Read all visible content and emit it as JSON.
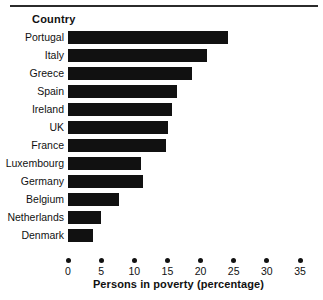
{
  "chart_data": {
    "type": "bar",
    "orientation": "horizontal",
    "title": "",
    "xlabel": "Persons in poverty (percentage)",
    "ylabel": "Country",
    "categories": [
      "Portugal",
      "Italy",
      "Greece",
      "Spain",
      "Ireland",
      "UK",
      "France",
      "Luxembourg",
      "Germany",
      "Belgium",
      "Netherlands",
      "Denmark"
    ],
    "values": [
      24.1,
      21.0,
      18.7,
      16.4,
      15.7,
      15.1,
      14.8,
      11.0,
      11.3,
      7.7,
      5.0,
      3.8
    ],
    "xlim": [
      0,
      35
    ],
    "xticks": [
      0,
      5,
      10,
      15,
      20,
      25,
      30,
      35
    ],
    "xtick_labels": [
      "0",
      "5",
      "10",
      "15",
      "20",
      "25",
      "30",
      "35"
    ],
    "grid": false,
    "legend": "none",
    "bar_color": "#111111"
  },
  "header": {
    "category_axis_title": "Country"
  },
  "axis": {
    "x_title": "Persons in poverty (percentage)"
  }
}
